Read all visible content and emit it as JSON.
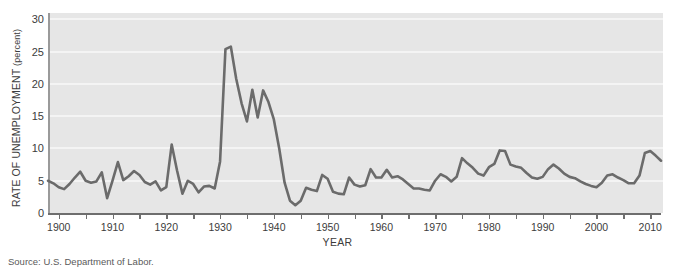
{
  "figure": {
    "top_cropped_caption": "",
    "source_note": "Source: U.S. Department of Labor."
  },
  "chart_data": {
    "type": "line",
    "title": "",
    "xlabel": "YEAR",
    "ylabel": "RATE OF UNEMPLOYMENT (percent)",
    "ylabel_main": "RATE OF UNEMPLOYMENT",
    "ylabel_unit": "(percent)",
    "xlim": [
      1898,
      2012
    ],
    "ylim": [
      0,
      31
    ],
    "grid": true,
    "gridlines_y": [
      0,
      5,
      10,
      15,
      20,
      25,
      30
    ],
    "legend": null,
    "colors": {
      "line": "#6b6b6b",
      "panel_background": "#e6e6e6",
      "gridline": "#f4f4f4",
      "axis": "#6e6e6e",
      "text": "#3c3c3c"
    },
    "y_ticks": [
      0,
      5,
      10,
      15,
      20,
      25,
      30
    ],
    "y_tick_labels": [
      "0",
      "5",
      "10",
      "15",
      "20",
      "25",
      "30"
    ],
    "x_ticks": [
      1900,
      1905,
      1910,
      1915,
      1920,
      1925,
      1930,
      1935,
      1940,
      1945,
      1950,
      1955,
      1960,
      1965,
      1970,
      1975,
      1980,
      1985,
      1990,
      1995,
      2000,
      2005,
      2010
    ],
    "x_tick_labels_major": [
      1900,
      1910,
      1920,
      1930,
      1940,
      1950,
      1960,
      1970,
      1980,
      1990,
      2000,
      2010
    ],
    "x_tick_labels_major_text": [
      "1900",
      "1910",
      "1920",
      "1930",
      "1940",
      "1950",
      "1960",
      "1970",
      "1980",
      "1990",
      "2000",
      "2010"
    ],
    "series_name": "Rate of unemployment",
    "x": [
      1898,
      1899,
      1900,
      1901,
      1902,
      1903,
      1904,
      1905,
      1906,
      1907,
      1908,
      1909,
      1910,
      1911,
      1912,
      1913,
      1914,
      1915,
      1916,
      1917,
      1918,
      1919,
      1920,
      1921,
      1922,
      1923,
      1924,
      1925,
      1926,
      1927,
      1928,
      1929,
      1930,
      1931,
      1932,
      1933,
      1934,
      1935,
      1936,
      1937,
      1938,
      1939,
      1940,
      1941,
      1942,
      1943,
      1944,
      1945,
      1946,
      1947,
      1948,
      1949,
      1950,
      1951,
      1952,
      1953,
      1954,
      1955,
      1956,
      1957,
      1958,
      1959,
      1960,
      1961,
      1962,
      1963,
      1964,
      1965,
      1966,
      1967,
      1968,
      1969,
      1970,
      1971,
      1972,
      1973,
      1974,
      1975,
      1976,
      1977,
      1978,
      1979,
      1980,
      1981,
      1982,
      1983,
      1984,
      1985,
      1986,
      1987,
      1988,
      1989,
      1990,
      1991,
      1992,
      1993,
      1994,
      1995,
      1996,
      1997,
      1998,
      1999,
      2000,
      2001,
      2002,
      2003,
      2004,
      2005,
      2006,
      2007,
      2008,
      2009,
      2010,
      2011,
      2012
    ],
    "values": [
      5.0,
      4.6,
      4.0,
      3.7,
      4.5,
      5.5,
      6.4,
      5.0,
      4.7,
      4.9,
      6.3,
      2.3,
      5.0,
      7.9,
      5.1,
      5.7,
      6.5,
      5.9,
      4.8,
      4.4,
      4.9,
      3.5,
      4.0,
      10.6,
      6.6,
      3.0,
      5.0,
      4.5,
      3.2,
      4.1,
      4.2,
      3.8,
      8.0,
      25.4,
      25.8,
      20.8,
      17.0,
      14.2,
      19.1,
      14.8,
      19.0,
      17.2,
      14.5,
      10.0,
      4.7,
      1.9,
      1.2,
      1.9,
      3.9,
      3.6,
      3.4,
      5.9,
      5.3,
      3.3,
      3.0,
      2.9,
      5.5,
      4.4,
      4.1,
      4.3,
      6.8,
      5.5,
      5.5,
      6.7,
      5.5,
      5.7,
      5.2,
      4.5,
      3.8,
      3.8,
      3.6,
      3.5,
      5.0,
      6.0,
      5.6,
      4.9,
      5.6,
      8.5,
      7.7,
      7.0,
      6.1,
      5.8,
      7.1,
      7.6,
      9.7,
      9.6,
      7.5,
      7.2,
      7.0,
      6.2,
      5.5,
      5.3,
      5.6,
      6.8,
      7.5,
      6.9,
      6.1,
      5.6,
      5.4,
      4.9,
      4.5,
      4.2,
      4.0,
      4.7,
      5.8,
      6.0,
      5.5,
      5.1,
      4.6,
      4.6,
      5.8,
      9.3,
      9.6,
      8.9,
      8.1
    ]
  }
}
